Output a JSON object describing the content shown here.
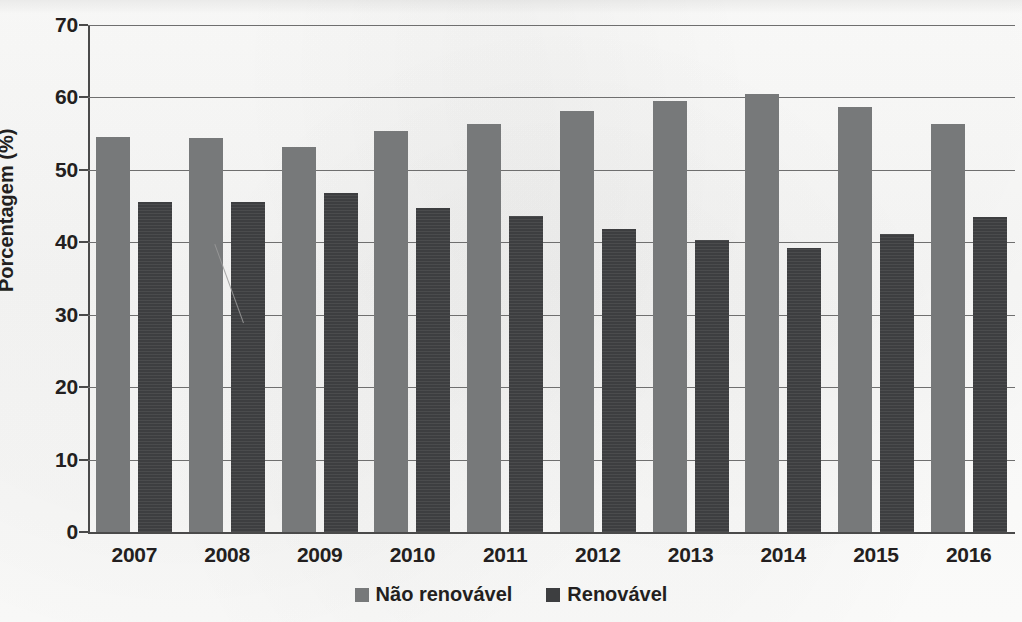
{
  "chart_data": {
    "type": "bar",
    "title": "",
    "xlabel": "",
    "ylabel": "Porcentagem (%)",
    "categories": [
      "2007",
      "2008",
      "2009",
      "2010",
      "2011",
      "2012",
      "2013",
      "2014",
      "2015",
      "2016"
    ],
    "series": [
      {
        "name": "Não renovável",
        "color": "#77797a",
        "values": [
          54.5,
          54.4,
          53.2,
          55.3,
          56.4,
          58.1,
          59.5,
          60.5,
          58.7,
          56.4
        ]
      },
      {
        "name": "Renovável",
        "color": "#3d3e40",
        "values": [
          45.5,
          45.6,
          46.8,
          44.8,
          43.6,
          41.8,
          40.3,
          39.2,
          41.2,
          43.5
        ]
      }
    ],
    "ylim": [
      0,
      70
    ],
    "y_ticks": [
      "0",
      "10",
      "20",
      "30",
      "40",
      "50",
      "60",
      "70"
    ],
    "y_tick_values": [
      0,
      10,
      20,
      30,
      40,
      50,
      60,
      70
    ],
    "grid": "horizontal",
    "legend_position": "bottom"
  },
  "legend": {
    "items": [
      {
        "label": "Não renovável",
        "swatch": "nonrenew"
      },
      {
        "label": "Renovável",
        "swatch": "renew"
      }
    ]
  }
}
